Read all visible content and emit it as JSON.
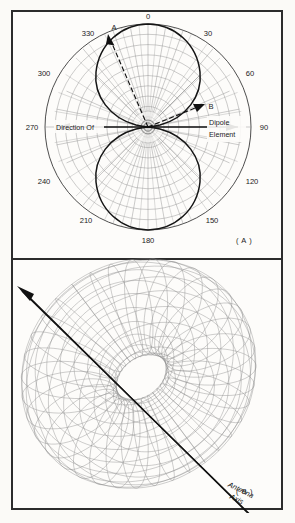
{
  "figure": {
    "background_color": "#fbfaf7",
    "border_color": "#2c2c2c",
    "line_color": "#555555",
    "grid_color": "#8d8d8d",
    "pattern_color": "#1a1a1a",
    "text_color": "#1a1a1a"
  },
  "panel_a": {
    "label": "( A )",
    "type": "polar-radiation-pattern",
    "angle_labels": [
      {
        "value": "0",
        "angle_deg": 0
      },
      {
        "value": "30",
        "angle_deg": 30
      },
      {
        "value": "60",
        "angle_deg": 60
      },
      {
        "value": "90",
        "angle_deg": 90
      },
      {
        "value": "120",
        "angle_deg": 120
      },
      {
        "value": "150",
        "angle_deg": 150
      },
      {
        "value": "180",
        "angle_deg": 180
      },
      {
        "value": "210",
        "angle_deg": 210
      },
      {
        "value": "240",
        "angle_deg": 240
      },
      {
        "value": "270",
        "angle_deg": 270
      },
      {
        "value": "300",
        "angle_deg": 300
      },
      {
        "value": "330",
        "angle_deg": 330
      }
    ],
    "annotations": {
      "marker_a": "A",
      "marker_b": "B",
      "direction_label_line1": "Direction Of",
      "dipole_label_line1": "Dipole",
      "dipole_label_line2": "Element"
    },
    "grid": {
      "ring_count": 10,
      "spoke_count": 36,
      "spoke_step_deg": 10
    },
    "pattern": {
      "description": "figure-eight dipole pattern, nulls along 90 and 270 degrees, maxima along 0 and 180 degrees"
    }
  },
  "panel_b": {
    "label": "( B )",
    "type": "three-dimensional-torus",
    "annotations": {
      "axis_label_line1": "Antenna",
      "axis_label_line2": "Axis"
    },
    "wireframe": {
      "meridian_count": 36,
      "parallel_count": 20
    }
  },
  "chart_data": {
    "type": "line",
    "title": "",
    "charts": [
      {
        "id": "panel-a",
        "type": "polar",
        "title": "( A )",
        "xlabel": "",
        "ylabel": "",
        "theta_unit": "degrees",
        "theta_ticks": [
          0,
          30,
          60,
          90,
          120,
          150,
          180,
          210,
          240,
          270,
          300,
          330
        ],
        "theta_tick_labels": [
          "0",
          "30",
          "60",
          "90",
          "120",
          "150",
          "180",
          "210",
          "240",
          "270",
          "300",
          "330"
        ],
        "r_range": [
          0,
          1
        ],
        "grid": true,
        "legend": "none",
        "series": [
          {
            "name": "dipole-pattern",
            "formula": "r = |cos(theta)|",
            "theta": [
              0,
              10,
              20,
              30,
              40,
              50,
              60,
              70,
              80,
              90,
              100,
              110,
              120,
              130,
              140,
              150,
              160,
              170,
              180,
              190,
              200,
              210,
              220,
              230,
              240,
              250,
              260,
              270,
              280,
              290,
              300,
              310,
              320,
              330,
              340,
              350,
              360
            ],
            "r": [
              1.0,
              0.98,
              0.94,
              0.87,
              0.77,
              0.64,
              0.5,
              0.34,
              0.17,
              0.0,
              0.17,
              0.34,
              0.5,
              0.64,
              0.77,
              0.87,
              0.94,
              0.98,
              1.0,
              0.98,
              0.94,
              0.87,
              0.77,
              0.64,
              0.5,
              0.34,
              0.17,
              0.0,
              0.17,
              0.34,
              0.5,
              0.64,
              0.77,
              0.87,
              0.94,
              0.98,
              1.0
            ]
          }
        ],
        "annotations": [
          {
            "text": "A",
            "theta_deg": 340,
            "note": "arrow along upper-left radial"
          },
          {
            "text": "B",
            "theta_deg": 68,
            "note": "arrow along lower-right radial"
          },
          {
            "text": "Direction Of",
            "theta_deg": 270
          },
          {
            "text": "Dipole Element",
            "theta_deg": 90
          }
        ]
      },
      {
        "id": "panel-b",
        "type": "surface",
        "title": "( B )",
        "shape": "torus",
        "annotations": [
          {
            "text": "Antenna Axis",
            "note": "double-headed arrow through torus hole"
          }
        ]
      }
    ]
  }
}
